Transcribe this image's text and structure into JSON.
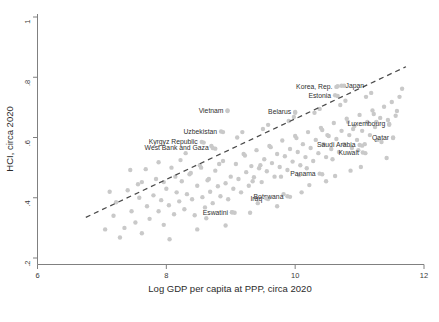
{
  "chart_data": {
    "type": "scatter",
    "title": "",
    "xlabel": "Log GDP per capita at PPP, circa 2020",
    "ylabel": "HCI, circa 2020",
    "xlim": [
      6,
      12
    ],
    "ylim": [
      0.2,
      1.0
    ],
    "xticks": [
      "6",
      "8",
      "10",
      "12"
    ],
    "xtick_values": [
      6,
      8,
      10,
      12
    ],
    "yticks": [
      ".2",
      ".4",
      ".6",
      ".8",
      "1"
    ],
    "ytick_values": [
      0.2,
      0.4,
      0.6,
      0.8,
      1.0
    ],
    "grid": false,
    "legend": "none",
    "marker_color": "#c9c9c9",
    "fitline_color": "#4a4a4a",
    "fitline_style": "dashed",
    "fitline": {
      "x0": 6.75,
      "y0": 0.335,
      "x1": 11.72,
      "y1": 0.835
    },
    "annotations": [
      {
        "label": "Vietnam",
        "x": 8.95,
        "y": 0.69,
        "anchor": "end"
      },
      {
        "label": "Belarus",
        "x": 10.0,
        "y": 0.685,
        "anchor": "end"
      },
      {
        "label": "Korea, Rep.",
        "x": 10.64,
        "y": 0.768,
        "anchor": "end"
      },
      {
        "label": "Japan",
        "x": 10.72,
        "y": 0.772,
        "anchor": "start"
      },
      {
        "label": "Estonia",
        "x": 10.62,
        "y": 0.74,
        "anchor": "end"
      },
      {
        "label": "Luxembourg",
        "x": 11.46,
        "y": 0.645,
        "anchor": "end"
      },
      {
        "label": "Qatar",
        "x": 11.52,
        "y": 0.6,
        "anchor": "end"
      },
      {
        "label": "Uzbekistan",
        "x": 8.85,
        "y": 0.62,
        "anchor": "end"
      },
      {
        "label": "Kyrgyz Republic",
        "x": 8.55,
        "y": 0.585,
        "anchor": "end"
      },
      {
        "label": "West Bank and Gaza",
        "x": 8.72,
        "y": 0.565,
        "anchor": "end"
      },
      {
        "label": "Saudi Arabia",
        "x": 11.0,
        "y": 0.575,
        "anchor": "end"
      },
      {
        "label": "Kuwait",
        "x": 11.05,
        "y": 0.55,
        "anchor": "end"
      },
      {
        "label": "Panama",
        "x": 10.38,
        "y": 0.48,
        "anchor": "end"
      },
      {
        "label": "Botswana",
        "x": 9.88,
        "y": 0.405,
        "anchor": "end"
      },
      {
        "label": "Iraq",
        "x": 9.55,
        "y": 0.398,
        "anchor": "end"
      },
      {
        "label": "Eswatini",
        "x": 9.02,
        "y": 0.352,
        "anchor": "end"
      }
    ],
    "points": [
      [
        7.05,
        0.295
      ],
      [
        7.18,
        0.34
      ],
      [
        7.22,
        0.385
      ],
      [
        7.35,
        0.3
      ],
      [
        7.4,
        0.425
      ],
      [
        7.46,
        0.355
      ],
      [
        7.52,
        0.318
      ],
      [
        7.58,
        0.4
      ],
      [
        7.62,
        0.452
      ],
      [
        7.7,
        0.372
      ],
      [
        7.74,
        0.33
      ],
      [
        7.8,
        0.408
      ],
      [
        7.84,
        0.462
      ],
      [
        7.88,
        0.355
      ],
      [
        7.92,
        0.392
      ],
      [
        7.96,
        0.31
      ],
      [
        8.0,
        0.43
      ],
      [
        8.04,
        0.375
      ],
      [
        8.08,
        0.5
      ],
      [
        8.12,
        0.345
      ],
      [
        8.16,
        0.418
      ],
      [
        8.2,
        0.388
      ],
      [
        8.24,
        0.455
      ],
      [
        8.28,
        0.362
      ],
      [
        8.32,
        0.412
      ],
      [
        8.36,
        0.478
      ],
      [
        8.4,
        0.395
      ],
      [
        8.44,
        0.342
      ],
      [
        8.48,
        0.44
      ],
      [
        8.52,
        0.508
      ],
      [
        8.56,
        0.402
      ],
      [
        8.6,
        0.368
      ],
      [
        8.64,
        0.458
      ],
      [
        8.68,
        0.42
      ],
      [
        8.72,
        0.382
      ],
      [
        8.76,
        0.49
      ],
      [
        8.8,
        0.438
      ],
      [
        8.84,
        0.405
      ],
      [
        8.88,
        0.522
      ],
      [
        8.92,
        0.448
      ],
      [
        8.96,
        0.395
      ],
      [
        9.0,
        0.47
      ],
      [
        9.04,
        0.43
      ],
      [
        9.08,
        0.512
      ],
      [
        9.12,
        0.462
      ],
      [
        9.16,
        0.418
      ],
      [
        9.2,
        0.545
      ],
      [
        9.24,
        0.485
      ],
      [
        9.28,
        0.44
      ],
      [
        9.32,
        0.505
      ],
      [
        9.36,
        0.468
      ],
      [
        9.4,
        0.558
      ],
      [
        9.44,
        0.498
      ],
      [
        9.48,
        0.452
      ],
      [
        9.52,
        0.528
      ],
      [
        9.56,
        0.488
      ],
      [
        9.6,
        0.572
      ],
      [
        9.64,
        0.515
      ],
      [
        9.68,
        0.47
      ],
      [
        9.72,
        0.545
      ],
      [
        9.76,
        0.502
      ],
      [
        9.8,
        0.59
      ],
      [
        9.84,
        0.538
      ],
      [
        9.88,
        0.492
      ],
      [
        9.92,
        0.562
      ],
      [
        9.96,
        0.52
      ],
      [
        10.0,
        0.605
      ],
      [
        10.04,
        0.552
      ],
      [
        10.08,
        0.508
      ],
      [
        10.12,
        0.578
      ],
      [
        10.16,
        0.535
      ],
      [
        10.2,
        0.618
      ],
      [
        10.24,
        0.565
      ],
      [
        10.28,
        0.522
      ],
      [
        10.32,
        0.592
      ],
      [
        10.36,
        0.548
      ],
      [
        10.4,
        0.632
      ],
      [
        10.44,
        0.578
      ],
      [
        10.48,
        0.535
      ],
      [
        10.52,
        0.605
      ],
      [
        10.56,
        0.562
      ],
      [
        10.6,
        0.648
      ],
      [
        10.64,
        0.595
      ],
      [
        10.68,
        0.552
      ],
      [
        10.72,
        0.622
      ],
      [
        10.76,
        0.578
      ],
      [
        10.8,
        0.662
      ],
      [
        10.84,
        0.608
      ],
      [
        10.88,
        0.565
      ],
      [
        10.92,
        0.638
      ],
      [
        10.96,
        0.592
      ],
      [
        11.0,
        0.675
      ],
      [
        11.04,
        0.622
      ],
      [
        11.08,
        0.578
      ],
      [
        11.12,
        0.652
      ],
      [
        11.16,
        0.608
      ],
      [
        11.2,
        0.69
      ],
      [
        11.24,
        0.635
      ],
      [
        11.28,
        0.592
      ],
      [
        11.32,
        0.665
      ],
      [
        11.38,
        0.702
      ],
      [
        11.44,
        0.658
      ],
      [
        11.5,
        0.718
      ],
      [
        11.56,
        0.672
      ],
      [
        11.62,
        0.735
      ],
      [
        7.28,
        0.268
      ],
      [
        7.62,
        0.282
      ],
      [
        8.05,
        0.262
      ],
      [
        8.48,
        0.295
      ],
      [
        8.92,
        0.308
      ],
      [
        9.3,
        0.35
      ],
      [
        9.72,
        0.372
      ],
      [
        10.1,
        0.418
      ],
      [
        10.48,
        0.455
      ],
      [
        10.86,
        0.49
      ],
      [
        7.44,
        0.492
      ],
      [
        7.88,
        0.518
      ],
      [
        8.3,
        0.548
      ],
      [
        8.7,
        0.572
      ],
      [
        9.1,
        0.6
      ],
      [
        9.5,
        0.628
      ],
      [
        9.9,
        0.655
      ],
      [
        10.3,
        0.682
      ],
      [
        10.7,
        0.708
      ],
      [
        11.1,
        0.735
      ],
      [
        7.96,
        0.452
      ],
      [
        8.38,
        0.482
      ],
      [
        8.82,
        0.512
      ],
      [
        9.22,
        0.54
      ],
      [
        9.62,
        0.568
      ],
      [
        10.02,
        0.598
      ],
      [
        10.42,
        0.625
      ],
      [
        10.82,
        0.652
      ],
      [
        11.22,
        0.678
      ],
      [
        8.62,
        0.332
      ],
      [
        9.02,
        0.352
      ],
      [
        9.42,
        0.382
      ],
      [
        9.82,
        0.412
      ],
      [
        10.22,
        0.442
      ],
      [
        10.62,
        0.472
      ],
      [
        11.02,
        0.502
      ],
      [
        11.42,
        0.532
      ],
      [
        9.18,
        0.618
      ],
      [
        9.58,
        0.642
      ],
      [
        9.98,
        0.668
      ],
      [
        10.38,
        0.695
      ],
      [
        10.78,
        0.722
      ],
      [
        11.18,
        0.748
      ],
      [
        11.46,
        0.642
      ],
      [
        11.52,
        0.598
      ],
      [
        8.95,
        0.688
      ],
      [
        10.0,
        0.682
      ],
      [
        10.66,
        0.77
      ],
      [
        10.76,
        0.772
      ],
      [
        10.66,
        0.738
      ],
      [
        8.88,
        0.618
      ],
      [
        8.58,
        0.583
      ],
      [
        8.76,
        0.563
      ],
      [
        11.04,
        0.573
      ],
      [
        11.09,
        0.548
      ],
      [
        10.42,
        0.478
      ],
      [
        9.92,
        0.403
      ],
      [
        9.58,
        0.396
      ],
      [
        9.06,
        0.35
      ],
      [
        7.12,
        0.42
      ],
      [
        7.56,
        0.445
      ],
      [
        8.14,
        0.47
      ],
      [
        8.54,
        0.5
      ],
      [
        9.34,
        0.455
      ],
      [
        9.78,
        0.47
      ],
      [
        10.18,
        0.498
      ],
      [
        10.58,
        0.528
      ],
      [
        10.98,
        0.558
      ],
      [
        11.34,
        0.585
      ],
      [
        7.68,
        0.495
      ],
      [
        8.22,
        0.525
      ],
      [
        8.66,
        0.462
      ],
      [
        9.46,
        0.508
      ],
      [
        10.06,
        0.475
      ],
      [
        10.5,
        0.608
      ],
      [
        10.9,
        0.628
      ],
      [
        11.26,
        0.652
      ],
      [
        11.58,
        0.688
      ],
      [
        11.66,
        0.762
      ]
    ]
  }
}
